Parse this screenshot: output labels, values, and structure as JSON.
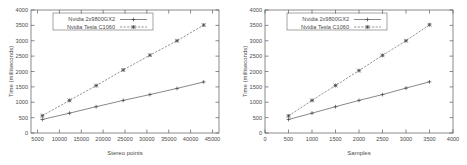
{
  "figure": {
    "background": "#ffffff",
    "series_colors": {
      "gx2": "#555555",
      "tesla": "#666666"
    }
  },
  "chart_data": [
    {
      "type": "line",
      "title": "",
      "xlabel": "Stereo points",
      "ylabel": "Time (milliseconds)",
      "xlim": [
        3500,
        46500
      ],
      "ylim": [
        0,
        4000
      ],
      "xticks": [
        5000,
        10000,
        15000,
        20000,
        25000,
        30000,
        35000,
        40000,
        45000
      ],
      "yticks": [
        0,
        500,
        1000,
        1500,
        2000,
        2500,
        3000,
        3500,
        4000
      ],
      "grid": false,
      "legend_position": "top-left",
      "x": [
        6100,
        12300,
        18400,
        24600,
        30700,
        36900,
        43000
      ],
      "series": [
        {
          "name": "Nvidia 2x9800GX2",
          "marker": "plus",
          "line": "solid",
          "values": [
            440,
            645,
            855,
            1060,
            1250,
            1450,
            1660
          ]
        },
        {
          "name": "Nvidia Tesla C1060",
          "marker": "star",
          "line": "dashed",
          "values": [
            560,
            1060,
            1540,
            2050,
            2530,
            3000,
            3510
          ]
        }
      ]
    },
    {
      "type": "line",
      "title": "",
      "xlabel": "Samples",
      "ylabel": "Time (milliseconds)",
      "xlim": [
        0,
        4000
      ],
      "ylim": [
        0,
        4000
      ],
      "xticks": [
        0,
        500,
        1000,
        1500,
        2000,
        2500,
        3000,
        3500,
        4000
      ],
      "yticks": [
        0,
        500,
        1000,
        1500,
        2000,
        2500,
        3000,
        3500,
        4000
      ],
      "grid": false,
      "legend_position": "top-left",
      "x": [
        500,
        1000,
        1500,
        2000,
        2500,
        3000,
        3500
      ],
      "series": [
        {
          "name": "Nvidia 2x9800GX2",
          "marker": "plus",
          "line": "solid",
          "values": [
            440,
            645,
            855,
            1060,
            1250,
            1460,
            1665
          ]
        },
        {
          "name": "Nvidia Tesla C1060",
          "marker": "star",
          "line": "dashed",
          "values": [
            555,
            1060,
            1545,
            2030,
            2525,
            3000,
            3520
          ]
        }
      ]
    }
  ]
}
